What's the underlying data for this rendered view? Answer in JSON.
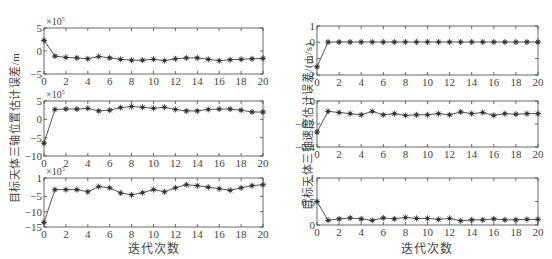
{
  "figure": {
    "left_column": {
      "ylabel": "目标天体三轴位置估计误差/m",
      "xlabel": "迭代次数"
    },
    "right_column": {
      "ylabel": "目标天体三轴速度估计误差/(m/s)",
      "xlabel": "迭代次数"
    }
  },
  "chart_data": [
    {
      "type": "line",
      "id": "pos_x",
      "title": "",
      "xlabel": "",
      "ylabel": "目标天体三轴位置估计误差/m",
      "multiplier_label": "×10^5",
      "x": [
        0,
        1,
        2,
        3,
        4,
        5,
        6,
        7,
        8,
        9,
        10,
        11,
        12,
        13,
        14,
        15,
        16,
        17,
        18,
        19,
        20
      ],
      "values": [
        2.3,
        -1.1,
        -1.4,
        -1.5,
        -1.7,
        -1.2,
        -1.5,
        -1.8,
        -2.0,
        -2.0,
        -1.8,
        -2.1,
        -1.7,
        -1.5,
        -1.5,
        -1.8,
        -2.1,
        -1.9,
        -1.8,
        -1.7,
        -1.6
      ],
      "xlim": [
        0,
        20
      ],
      "ylim": [
        -5,
        5
      ],
      "xticks": [
        0,
        2,
        4,
        6,
        8,
        10,
        12,
        14,
        16,
        18,
        20
      ],
      "yticks": [
        -5,
        0,
        5
      ],
      "marker": "asterisk",
      "grid": false
    },
    {
      "type": "line",
      "id": "pos_y",
      "title": "",
      "xlabel": "",
      "ylabel": "目标天体三轴位置估计误差/m",
      "multiplier_label": "×10^5",
      "x": [
        0,
        1,
        2,
        3,
        4,
        5,
        6,
        7,
        8,
        9,
        10,
        11,
        12,
        13,
        14,
        15,
        16,
        17,
        18,
        19,
        20
      ],
      "values": [
        -6.5,
        2.7,
        2.8,
        2.8,
        3.0,
        2.3,
        2.5,
        3.2,
        3.5,
        3.3,
        3.0,
        3.3,
        2.7,
        2.3,
        2.3,
        2.7,
        2.8,
        2.8,
        2.5,
        2.0,
        2.0
      ],
      "xlim": [
        0,
        20
      ],
      "ylim": [
        -10,
        5
      ],
      "xticks": [
        0,
        2,
        4,
        6,
        8,
        10,
        12,
        14,
        16,
        18,
        20
      ],
      "yticks": [
        -10,
        -5,
        0,
        5
      ],
      "marker": "asterisk",
      "grid": false
    },
    {
      "type": "line",
      "id": "pos_z",
      "title": "",
      "xlabel": "迭代次数",
      "ylabel": "目标天体三轴位置估计误差/m",
      "multiplier_label": "×10^5",
      "x": [
        0,
        1,
        2,
        3,
        4,
        5,
        6,
        7,
        8,
        9,
        10,
        11,
        12,
        13,
        14,
        15,
        16,
        17,
        18,
        19,
        20
      ],
      "values": [
        -13.5,
        -2.8,
        -2.8,
        -2.8,
        -3.5,
        -1.8,
        -2.2,
        -3.9,
        -4.5,
        -3.8,
        -2.8,
        -3.5,
        -2.2,
        -1.2,
        -1.5,
        -2.0,
        -2.5,
        -3.0,
        -2.2,
        -1.5,
        -1.2
      ],
      "xlim": [
        0,
        20
      ],
      "ylim": [
        -15,
        1
      ],
      "xticks": [
        0,
        2,
        4,
        6,
        8,
        10,
        12,
        14,
        16,
        18,
        20
      ],
      "yticks": [
        -15,
        -10,
        -5,
        1
      ],
      "marker": "asterisk",
      "grid": false
    },
    {
      "type": "line",
      "id": "vel_x",
      "title": "",
      "xlabel": "",
      "ylabel": "目标天体三轴速度估计误差/(m/s)",
      "x": [
        0,
        1,
        2,
        3,
        4,
        5,
        6,
        7,
        8,
        9,
        10,
        11,
        12,
        13,
        14,
        15,
        16,
        17,
        18,
        19,
        20
      ],
      "values": [
        -1.5,
        0.02,
        0.02,
        0.02,
        0.02,
        0.02,
        0.02,
        0.02,
        0.02,
        0.02,
        0.02,
        0.02,
        0.02,
        0.02,
        0.02,
        0.02,
        0.02,
        0.02,
        0.02,
        0.02,
        0.02
      ],
      "xlim": [
        0,
        20
      ],
      "ylim": [
        -2,
        1
      ],
      "xticks": [
        0,
        2,
        4,
        6,
        8,
        10,
        12,
        14,
        16,
        18,
        20
      ],
      "yticks": [
        -2,
        -1,
        0,
        1
      ],
      "marker": "asterisk",
      "grid": false
    },
    {
      "type": "line",
      "id": "vel_y",
      "title": "",
      "xlabel": "",
      "ylabel": "目标天体三轴速度估计误差/(m/s)",
      "x": [
        0,
        1,
        2,
        3,
        4,
        5,
        6,
        7,
        8,
        9,
        10,
        11,
        12,
        13,
        14,
        15,
        16,
        17,
        18,
        19,
        20
      ],
      "values": [
        -0.27,
        -0.09,
        -0.1,
        -0.11,
        -0.12,
        -0.09,
        -0.12,
        -0.11,
        -0.125,
        -0.12,
        -0.12,
        -0.11,
        -0.12,
        -0.095,
        -0.11,
        -0.1,
        -0.125,
        -0.11,
        -0.115,
        -0.11,
        -0.11
      ],
      "xlim": [
        0,
        20
      ],
      "ylim": [
        -0.4,
        0
      ],
      "xticks": [
        0,
        2,
        4,
        6,
        8,
        10,
        12,
        14,
        16,
        18,
        20
      ],
      "yticks": [
        -0.4,
        -0.2,
        0
      ],
      "marker": "asterisk",
      "grid": false
    },
    {
      "type": "line",
      "id": "vel_z",
      "title": "",
      "xlabel": "迭代次数",
      "ylabel": "目标天体三轴速度估计误差/(m/s)",
      "x": [
        0,
        1,
        2,
        3,
        4,
        5,
        6,
        7,
        8,
        9,
        10,
        11,
        12,
        13,
        14,
        15,
        16,
        17,
        18,
        19,
        20
      ],
      "values": [
        0.5,
        0.1,
        0.13,
        0.15,
        0.13,
        0.1,
        0.15,
        0.13,
        0.16,
        0.14,
        0.14,
        0.12,
        0.14,
        0.09,
        0.11,
        0.11,
        0.13,
        0.11,
        0.11,
        0.12,
        0.12
      ],
      "xlim": [
        0,
        20
      ],
      "ylim": [
        0,
        1
      ],
      "xticks": [
        0,
        2,
        4,
        6,
        8,
        10,
        12,
        14,
        16,
        18,
        20
      ],
      "yticks": [
        0,
        0.5,
        1
      ],
      "marker": "asterisk",
      "grid": false
    }
  ],
  "colors": {
    "line": "#555555",
    "axes": "#444444",
    "marker": "#333333",
    "text": "#444444"
  },
  "multiplier_text": {
    "times": "×10",
    "exp": "5"
  }
}
